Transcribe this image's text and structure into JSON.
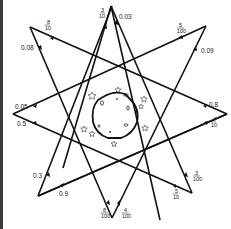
{
  "diagram": {
    "type": "octagram-with-planet",
    "stroke_color": "#111111",
    "background": "#ffffff",
    "left_border_color": "#3a3a3a",
    "outer_vertices": [
      {
        "name": "top",
        "x": 111,
        "y": 6
      },
      {
        "name": "upper-right",
        "x": 206,
        "y": 26
      },
      {
        "name": "right",
        "x": 227,
        "y": 114
      },
      {
        "name": "lower-right",
        "x": 192,
        "y": 193
      },
      {
        "name": "bottom",
        "x": 112,
        "y": 218
      },
      {
        "name": "lower-left",
        "x": 38,
        "y": 196
      },
      {
        "name": "left",
        "x": 13,
        "y": 114
      },
      {
        "name": "upper-left",
        "x": 30,
        "y": 27
      }
    ],
    "labels": [
      {
        "id": "top-left-frac",
        "num": "3",
        "den": "10",
        "x": 101,
        "y": 12
      },
      {
        "id": "top-right-dec",
        "text": "0.03",
        "x": 119,
        "y": 19
      },
      {
        "id": "upper-left-frac",
        "num": "8",
        "den": "10",
        "x": 46,
        "y": 24
      },
      {
        "id": "upper-left-dec",
        "text": "0.08",
        "x": 21,
        "y": 50
      },
      {
        "id": "upper-right-frac",
        "num": "5",
        "den": "100",
        "x": 178,
        "y": 28
      },
      {
        "id": "upper-right-dec",
        "text": "0.09",
        "x": 201,
        "y": 53
      },
      {
        "id": "left-top-dec",
        "text": "0.05",
        "x": 15,
        "y": 109
      },
      {
        "id": "left-bottom-dec",
        "text": "0.5",
        "x": 17,
        "y": 124
      },
      {
        "id": "right-top-dec",
        "text": "0.8",
        "x": 209,
        "y": 107
      },
      {
        "id": "right-bottom-frac",
        "num": "4",
        "den": "10",
        "x": 212,
        "y": 122
      },
      {
        "id": "lower-left-dec1",
        "text": "0.3",
        "x": 33,
        "y": 178
      },
      {
        "id": "lower-left-dec2",
        "text": "0.9",
        "x": 59,
        "y": 196
      },
      {
        "id": "lower-right-frac1",
        "num": "3",
        "den": "100",
        "x": 193,
        "y": 175
      },
      {
        "id": "lower-right-frac2",
        "num": "5",
        "den": "10",
        "x": 173,
        "y": 193
      },
      {
        "id": "bottom-left-frac",
        "num": "8",
        "den": "100",
        "x": 101,
        "y": 213
      },
      {
        "id": "bottom-right-frac",
        "num": "4",
        "den": "100",
        "x": 122,
        "y": 213
      }
    ],
    "planet": {
      "cx": 115,
      "cy": 114,
      "r": 24
    },
    "stars_count": 8
  }
}
